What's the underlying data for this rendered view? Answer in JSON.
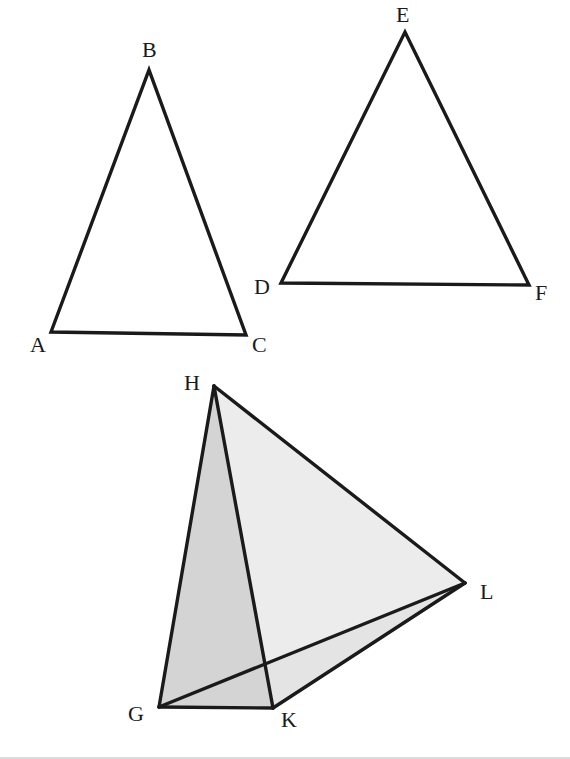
{
  "figure": {
    "type": "geometry-diagram",
    "colors": {
      "stroke": "#1a1a1a",
      "face_dark": "#d4d4d4",
      "face_light": "#eaeaea",
      "background": "#ffffff"
    },
    "triangle_abc": {
      "labels": {
        "A": "A",
        "B": "B",
        "C": "C"
      },
      "vertices": {
        "A": [
          51,
          332
        ],
        "B": [
          149,
          70
        ],
        "C": [
          246,
          335
        ]
      }
    },
    "triangle_def": {
      "labels": {
        "D": "D",
        "E": "E",
        "F": "F"
      },
      "vertices": {
        "D": [
          281,
          283
        ],
        "E": [
          405,
          32
        ],
        "F": [
          529,
          285
        ]
      }
    },
    "tetrahedron_ghkl": {
      "labels": {
        "G": "G",
        "H": "H",
        "K": "K",
        "L": "L"
      },
      "vertices": {
        "G": [
          159,
          707
        ],
        "H": [
          214,
          386
        ],
        "K": [
          273,
          708
        ],
        "L": [
          465,
          583
        ]
      },
      "edges": [
        "HG",
        "HK",
        "HL",
        "GK",
        "GL",
        "KL"
      ]
    }
  }
}
